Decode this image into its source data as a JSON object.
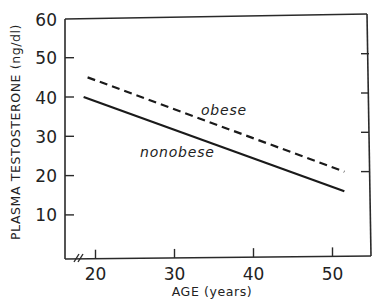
{
  "chart_data": {
    "type": "line",
    "title": "",
    "xlabel": "AGE (years)",
    "ylabel": "PLASMA TESTOSTERONE (ng/dl)",
    "xlim": [
      16,
      55
    ],
    "ylim": [
      0,
      60
    ],
    "x_ticks": [
      20,
      30,
      40,
      50
    ],
    "y_ticks": [
      10,
      20,
      30,
      40,
      50,
      60
    ],
    "x_tick_labels": [
      "20",
      "30",
      "40",
      "50"
    ],
    "y_tick_labels": [
      "10",
      "20",
      "30",
      "40",
      "50",
      "60"
    ],
    "grid": false,
    "axis_break": "x-axis near origin (//)",
    "legend": "inline labels",
    "series": [
      {
        "name": "obese",
        "style": "dashed",
        "x": [
          19,
          51.5
        ],
        "y": [
          45,
          21
        ]
      },
      {
        "name": "nonobese",
        "style": "solid",
        "x": [
          18.5,
          51.5
        ],
        "y": [
          40,
          16
        ]
      }
    ],
    "annotations": [
      {
        "text": "obese",
        "near_series": "obese",
        "x": 35,
        "y": 36
      },
      {
        "text": "nonobese",
        "near_series": "nonobese",
        "x": 26,
        "y": 25
      }
    ]
  }
}
